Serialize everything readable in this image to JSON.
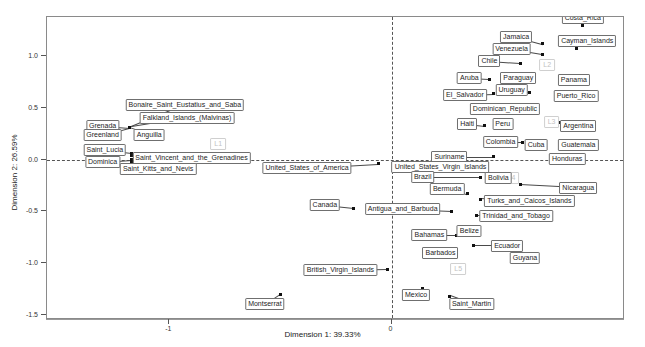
{
  "chart_data": {
    "type": "scatter",
    "title": "",
    "xlabel": "Dimension 1: 39.33%",
    "ylabel": "Dimension 2: 26.59%",
    "xlim": [
      -1.55,
      1.05
    ],
    "ylim": [
      -1.55,
      1.38
    ],
    "grid": false,
    "legend": null,
    "xticks": [
      -1,
      0
    ],
    "xticklabels": [
      "-1",
      "0"
    ],
    "yticks": [
      1.0,
      0.5,
      0.0,
      -0.5,
      -1.0,
      -1.5
    ],
    "yticklabels": [
      "1.0",
      "0.5",
      "0.0",
      "-0.5",
      "-1.0",
      "-1.5"
    ],
    "reference_lines": {
      "vertical_x": 0,
      "horizontal_y": 0
    },
    "points": [
      {
        "label": "Costa_Rica",
        "x": 0.86,
        "y": 1.3,
        "lx": 0.86,
        "ly": 1.37
      },
      {
        "label": "Jamaica",
        "x": 0.68,
        "y": 1.12,
        "lx": 0.56,
        "ly": 1.19
      },
      {
        "label": "Cayman_Islands",
        "x": 0.83,
        "y": 1.08,
        "lx": 0.88,
        "ly": 1.15
      },
      {
        "label": "Venezuela",
        "x": 0.68,
        "y": 1.02,
        "lx": 0.54,
        "ly": 1.07
      },
      {
        "label": "Chile",
        "x": 0.58,
        "y": 0.93,
        "lx": 0.44,
        "ly": 0.95
      },
      {
        "label": "Paraguay",
        "x": 0.62,
        "y": 0.78,
        "lx": 0.57,
        "ly": 0.79
      },
      {
        "label": "Aruba",
        "x": 0.44,
        "y": 0.78,
        "lx": 0.35,
        "ly": 0.79
      },
      {
        "label": "Panama",
        "x": 0.78,
        "y": 0.77,
        "lx": 0.82,
        "ly": 0.77
      },
      {
        "label": "Uruguay",
        "x": 0.62,
        "y": 0.65,
        "lx": 0.54,
        "ly": 0.67
      },
      {
        "label": "El_Salvador",
        "x": 0.46,
        "y": 0.64,
        "lx": 0.33,
        "ly": 0.63
      },
      {
        "label": "Puerto_Rico",
        "x": 0.79,
        "y": 0.62,
        "lx": 0.83,
        "ly": 0.62
      },
      {
        "label": "Dominican_Republic",
        "x": 0.62,
        "y": 0.47,
        "lx": 0.51,
        "ly": 0.49
      },
      {
        "label": "Argentina",
        "x": 0.75,
        "y": 0.36,
        "lx": 0.84,
        "ly": 0.33
      },
      {
        "label": "Haiti",
        "x": 0.42,
        "y": 0.33,
        "lx": 0.34,
        "ly": 0.35
      },
      {
        "label": "Peru",
        "x": 0.5,
        "y": 0.31,
        "lx": 0.5,
        "ly": 0.35
      },
      {
        "label": "Colombia",
        "x": 0.59,
        "y": 0.17,
        "lx": 0.49,
        "ly": 0.17
      },
      {
        "label": "Cuba",
        "x": 0.65,
        "y": 0.13,
        "lx": 0.65,
        "ly": 0.14
      },
      {
        "label": "Guatemala",
        "x": 0.8,
        "y": 0.14,
        "lx": 0.84,
        "ly": 0.14
      },
      {
        "label": "Honduras",
        "x": 0.76,
        "y": 0.02,
        "lx": 0.79,
        "ly": 0.01
      },
      {
        "label": "Suriname",
        "x": 0.46,
        "y": 0.03,
        "lx": 0.26,
        "ly": 0.03
      },
      {
        "label": "United_States_Virgin_Islands",
        "x": 0.34,
        "y": -0.05,
        "lx": 0.22,
        "ly": -0.07
      },
      {
        "label": "United_States_of_America",
        "x": -0.06,
        "y": -0.04,
        "lx": -0.38,
        "ly": -0.08
      },
      {
        "label": "Bolivia",
        "x": 0.46,
        "y": -0.18,
        "lx": 0.48,
        "ly": -0.18
      },
      {
        "label": "Brazil",
        "x": 0.4,
        "y": -0.17,
        "lx": 0.14,
        "ly": -0.17
      },
      {
        "label": "Nicaragua",
        "x": 0.58,
        "y": -0.24,
        "lx": 0.84,
        "ly": -0.27
      },
      {
        "label": "Bermuda",
        "x": 0.34,
        "y": -0.33,
        "lx": 0.25,
        "ly": -0.28
      },
      {
        "label": "Turks_and_Caicos_Islands",
        "x": 0.4,
        "y": -0.38,
        "lx": 0.62,
        "ly": -0.4
      },
      {
        "label": "Canada",
        "x": -0.17,
        "y": -0.47,
        "lx": -0.3,
        "ly": -0.44
      },
      {
        "label": "Antigua_and_Barbuda",
        "x": 0.27,
        "y": -0.5,
        "lx": 0.05,
        "ly": -0.48
      },
      {
        "label": "Trinidad_and_Tobago",
        "x": 0.38,
        "y": -0.54,
        "lx": 0.56,
        "ly": -0.54
      },
      {
        "label": "Belize",
        "x": 0.34,
        "y": -0.7,
        "lx": 0.35,
        "ly": -0.69
      },
      {
        "label": "Bahamas",
        "x": 0.29,
        "y": -0.73,
        "lx": 0.17,
        "ly": -0.73
      },
      {
        "label": "Ecuador",
        "x": 0.37,
        "y": -0.83,
        "lx": 0.52,
        "ly": -0.83
      },
      {
        "label": "Barbados",
        "x": 0.23,
        "y": -0.94,
        "lx": 0.22,
        "ly": -0.9
      },
      {
        "label": "Guyana",
        "x": 0.56,
        "y": -0.93,
        "lx": 0.6,
        "ly": -0.95
      },
      {
        "label": "British_Virgin_Islands",
        "x": -0.02,
        "y": -1.06,
        "lx": -0.23,
        "ly": -1.07
      },
      {
        "label": "Mexico",
        "x": 0.14,
        "y": -1.25,
        "lx": 0.11,
        "ly": -1.31
      },
      {
        "label": "Saint_Martin",
        "x": 0.26,
        "y": -1.32,
        "lx": 0.36,
        "ly": -1.4
      },
      {
        "label": "Montserrat",
        "x": -0.5,
        "y": -1.3,
        "lx": -0.57,
        "ly": -1.4
      },
      {
        "label": "Bonaire_Saint_Eustatius_and_Saba",
        "x": -1.18,
        "y": 0.31,
        "lx": -0.93,
        "ly": 0.53
      },
      {
        "label": "Falkland_Islands_(Malvinas)",
        "x": -1.18,
        "y": 0.31,
        "lx": -0.92,
        "ly": 0.4
      },
      {
        "label": "Grenada",
        "x": -1.18,
        "y": 0.31,
        "lx": -1.3,
        "ly": 0.33
      },
      {
        "label": "Greenland",
        "x": -1.18,
        "y": 0.31,
        "lx": -1.3,
        "ly": 0.24
      },
      {
        "label": "Anguilla",
        "x": -1.18,
        "y": 0.31,
        "lx": -1.09,
        "ly": 0.24
      },
      {
        "label": "Saint_Lucia",
        "x": -1.17,
        "y": 0.06,
        "lx": -1.29,
        "ly": 0.09
      },
      {
        "label": "Saint_Vincent_and_the_Grenadines",
        "x": -1.17,
        "y": 0.04,
        "lx": -0.9,
        "ly": 0.02
      },
      {
        "label": "Dominica",
        "x": -1.17,
        "y": 0.0,
        "lx": -1.3,
        "ly": -0.02
      },
      {
        "label": "Saint_Kitts_and_Nevis",
        "x": -1.17,
        "y": -0.02,
        "lx": -1.05,
        "ly": -0.09
      }
    ],
    "cluster_markers": [
      {
        "label": "L1",
        "x": -0.78,
        "y": 0.15
      },
      {
        "label": "L2",
        "x": 0.7,
        "y": 0.92
      },
      {
        "label": "L3",
        "x": 0.72,
        "y": 0.36
      },
      {
        "label": "L4",
        "x": 0.54,
        "y": -0.18
      },
      {
        "label": "L5",
        "x": 0.3,
        "y": -1.06
      }
    ]
  },
  "axes": {
    "x_title": "Dimension 1: 39.33%",
    "y_title": "Dimension 2: 26.59%",
    "x_tick_labels": [
      "-1",
      "0"
    ],
    "y_tick_labels": [
      "1.0",
      "0.5",
      "0.0",
      "-0.5",
      "-1.0",
      "-1.5"
    ]
  },
  "colors": {
    "point": "#111111",
    "label_border": "#6f6f6f",
    "label_text": "#1c1c1c",
    "cluster_text": "#c2c2c2",
    "frame": "#8a8a8a",
    "reference_line": "#555555",
    "background": "#ffffff"
  }
}
